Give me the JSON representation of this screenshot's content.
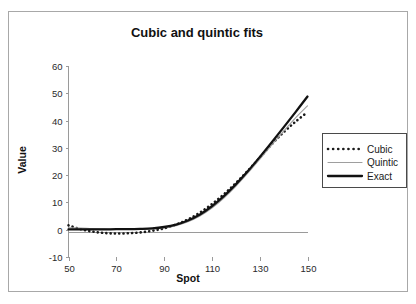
{
  "figure": {
    "border_color": "#a8a8a8",
    "background": "#ffffff"
  },
  "chart_data": {
    "type": "line",
    "title": "Cubic and quintic fits",
    "xlabel": "Spot",
    "ylabel": "Value",
    "xlim": [
      50,
      150
    ],
    "ylim": [
      -10,
      60
    ],
    "xticks": [
      50,
      70,
      90,
      110,
      130,
      150
    ],
    "yticks": [
      -10,
      0,
      10,
      20,
      30,
      40,
      50,
      60
    ],
    "xtick_labels": [
      "50",
      "70",
      "90",
      "110",
      "130",
      "150"
    ],
    "ytick_labels": [
      "-10",
      "0",
      "10",
      "20",
      "30",
      "40",
      "50",
      "60"
    ],
    "grid": false,
    "legend_position": "right",
    "x": [
      50,
      55,
      60,
      65,
      70,
      75,
      80,
      85,
      90,
      95,
      100,
      105,
      110,
      115,
      120,
      125,
      130,
      135,
      140,
      145,
      150
    ],
    "series": [
      {
        "name": "Cubic",
        "style": "dotted",
        "color": "#1a1a1a",
        "width": 2.6,
        "values": [
          1.6,
          0.2,
          -0.7,
          -1.2,
          -1.4,
          -1.3,
          -1.0,
          -0.4,
          0.5,
          1.9,
          3.8,
          6.3,
          9.4,
          13.0,
          17.1,
          21.6,
          26.4,
          31.3,
          35.7,
          39.6,
          43.1
        ]
      },
      {
        "name": "Quintic",
        "style": "solid",
        "color": "#9e9e9e",
        "width": 1.1,
        "values": [
          0.7,
          0.6,
          0.4,
          0.3,
          0.2,
          0.2,
          0.2,
          0.3,
          0.7,
          1.5,
          2.9,
          5.0,
          7.9,
          11.6,
          15.9,
          20.7,
          25.8,
          31.0,
          36.1,
          41.0,
          45.4
        ]
      },
      {
        "name": "Exact",
        "style": "solid",
        "color": "#111111",
        "width": 2.3,
        "values": [
          0.1,
          0.1,
          0.1,
          0.1,
          0.2,
          0.2,
          0.3,
          0.5,
          1.0,
          1.9,
          3.4,
          5.6,
          8.6,
          12.3,
          16.6,
          21.4,
          26.6,
          32.0,
          37.5,
          43.1,
          48.8
        ]
      }
    ]
  },
  "legend": {
    "entries": [
      {
        "label": "Cubic"
      },
      {
        "label": "Quintic"
      },
      {
        "label": "Exact"
      }
    ]
  }
}
